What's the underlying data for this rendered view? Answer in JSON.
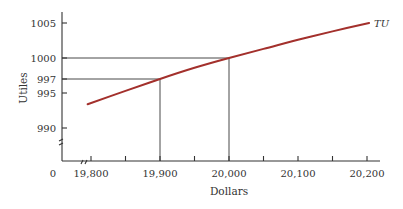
{
  "chart_data": {
    "type": "line",
    "title": "",
    "xlabel": "Dollars",
    "ylabel": "Utiles",
    "x_ticks": [
      19800,
      19900,
      20000,
      20100,
      20200
    ],
    "x_tick_labels": [
      "19,800",
      "19,900",
      "20,000",
      "20,100",
      "20,200"
    ],
    "x_minor_ticks": [
      19850,
      19950,
      20050,
      20150
    ],
    "y_ticks": [
      990,
      995,
      997,
      1000,
      1005
    ],
    "y_tick_labels": [
      "990",
      "995",
      "997",
      "1000",
      "1005"
    ],
    "origin_label": "0",
    "xlim": [
      19770,
      20210
    ],
    "ylim": [
      985,
      1005
    ],
    "axis_breaks": {
      "x": true,
      "y": true
    },
    "grid": false,
    "series": [
      {
        "name": "TU",
        "color": "#a3302c",
        "x": [
          19795,
          19850,
          19900,
          19950,
          20000,
          20050,
          20100,
          20150,
          20203
        ],
        "y": [
          993.4,
          995.3,
          997.0,
          998.6,
          1000.0,
          1001.3,
          1002.6,
          1003.8,
          1005.0
        ]
      }
    ],
    "reference_lines": [
      {
        "x": 19900,
        "y": 997
      },
      {
        "x": 20000,
        "y": 1000
      }
    ]
  }
}
